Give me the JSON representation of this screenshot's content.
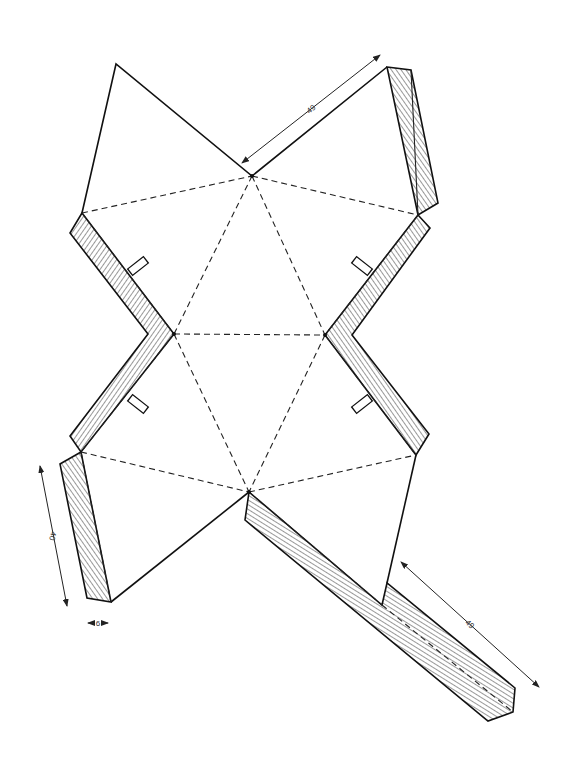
{
  "diagram": {
    "type": "paper-net-template",
    "colors": {
      "line": "#111111",
      "hatch": "#333333",
      "background": "#ffffff"
    },
    "dimensions": {
      "top_edge_label": "49",
      "left_tab_label": "40",
      "tab_width_label": "6",
      "bottom_strip_label": "49"
    },
    "legend": {
      "solid_line": "cut line",
      "dashed_line": "fold line",
      "hatched_area": "glue tab"
    }
  }
}
